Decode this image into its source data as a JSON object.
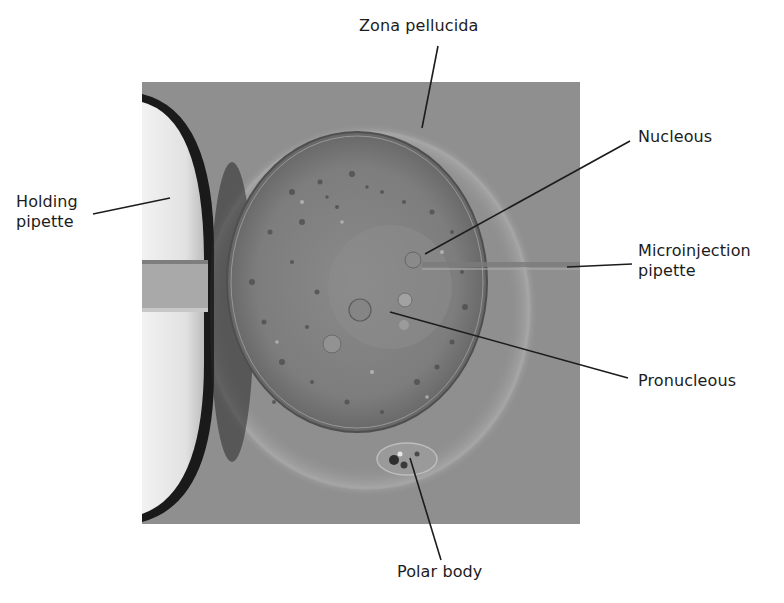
{
  "figure": {
    "labels": {
      "zona_pellucida": "Zona pellucida",
      "holding_pipette_line1": "Holding",
      "holding_pipette_line2": "pipette",
      "nucleous": "Nucleous",
      "microinjection_pipette_line1": "Microinjection",
      "microinjection_pipette_line2": "pipette",
      "pronucleous": "Pronucleous",
      "polar_body": "Polar body"
    },
    "colors": {
      "background": "#ffffff",
      "photo_medium": "#8e8e8e",
      "cytoplasm": "#7a7a7a",
      "pipette_glass": "#e8e8e8",
      "label_text": "#1c1c1c",
      "leader_line": "#1c1c1c"
    }
  }
}
